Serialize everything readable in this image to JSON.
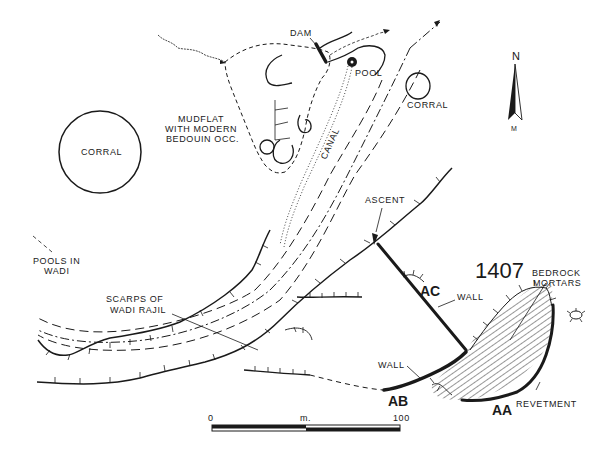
{
  "site": {
    "number": "1407"
  },
  "labels": {
    "dam": "DAM",
    "pool": "POOL",
    "corral_left": "CORRAL",
    "corral_right": "CORRAL",
    "mudflat_line1": "MUDFLAT",
    "mudflat_line2": "WITH MODERN",
    "mudflat_line3": "BEDOUIN OCC.",
    "canal": "CANAL",
    "ascent": "ASCENT",
    "pools_line1": "POOLS IN",
    "pools_line2": "WADI",
    "scarps_line1": "SCARPS OF",
    "scarps_line2": "WADI RAJIL",
    "bedrock_line1": "BEDROCK",
    "bedrock_line2": "MORTARS",
    "wall_ac": "WALL",
    "wall_ab": "WALL",
    "revetment": "REVETMENT"
  },
  "features": {
    "ac": "AC",
    "ab": "AB",
    "aa": "AA"
  },
  "north_arrow": {
    "top": "N",
    "bottom": "M"
  },
  "scale_bar": {
    "start": "0",
    "unit": "m.",
    "end": "100"
  }
}
